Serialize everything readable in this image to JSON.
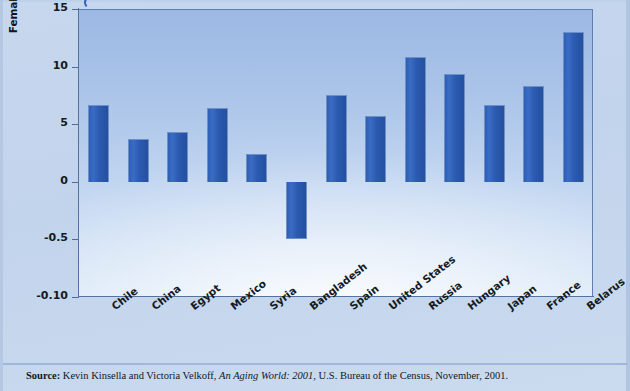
{
  "chart_data": {
    "type": "bar",
    "title": "",
    "xlabel": "",
    "ylabel": "Female Advantage in Life Expectancy at Birth: 2000",
    "ylim": [
      -10,
      15
    ],
    "ytick_labels": [
      "15",
      "10",
      "5",
      "0",
      "-0.5",
      "-0.10"
    ],
    "ytick_values": [
      15,
      10,
      5,
      0,
      -5,
      -10
    ],
    "grid": false,
    "legend": "none",
    "bar_color": "#2b5ab0",
    "plot_background": "#b6cdec",
    "categories": [
      "Chile",
      "China",
      "Egypt",
      "Mexico",
      "Syria",
      "Bangladesh",
      "Spain",
      "United States",
      "Russia",
      "Hungary",
      "Japan",
      "France",
      "Belarus"
    ],
    "values": [
      6.7,
      3.7,
      4.3,
      6.4,
      2.4,
      -5.0,
      7.5,
      5.7,
      10.8,
      9.4,
      6.7,
      8.3,
      13.0
    ]
  },
  "axis": {
    "y_title": "Female Advantage in Life Expectancy at Birth: 2000"
  },
  "footer": {
    "source_label": "Source:",
    "source_text_1": " Kevin Kinsella and Victoria Velkoff, ",
    "source_italic": "An Aging World: 2001",
    "source_text_2": ", U.S. Bureau of the Census, November, 2001."
  }
}
